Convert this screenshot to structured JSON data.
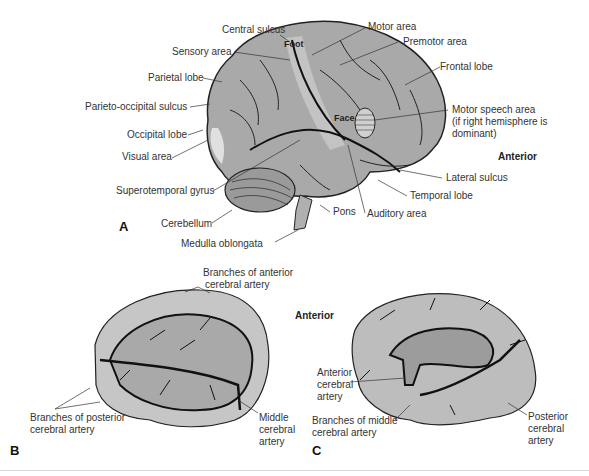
{
  "panels": {
    "A": {
      "letter": "A",
      "orientation": "Anterior",
      "labels": {
        "central_sulcus": "Central sulcus",
        "sensory_area": "Sensory area",
        "parietal_lobe": "Parietal lobe",
        "parieto_occipital_sulcus": "Parieto-occipital sulcus",
        "occipital_lobe": "Occipital lobe",
        "visual_area": "Visual area",
        "superotemporal_gyrus": "Superotemporal gyrus",
        "cerebellum": "Cerebellum",
        "medulla_oblongata": "Medulla oblongata",
        "motor_area": "Motor area",
        "premotor_area": "Premotor area",
        "frontal_lobe": "Frontal lobe",
        "motor_speech_1": "Motor speech area",
        "motor_speech_2": "(if right hemisphere is",
        "motor_speech_3": "dominant)",
        "lateral_sulcus": "Lateral sulcus",
        "temporal_lobe": "Temporal lobe",
        "pons": "Pons",
        "auditory_area": "Auditory area",
        "foot": "Foot",
        "face": "Face"
      }
    },
    "B": {
      "letter": "B",
      "orientation": "Anterior",
      "labels": {
        "anterior_branches_1": "Branches of anterior",
        "anterior_branches_2": "cerebral artery",
        "posterior_branches_1": "Branches of posterior",
        "posterior_branches_2": "cerebral artery",
        "middle_1": "Middle",
        "middle_2": "cerebral",
        "middle_3": "artery"
      }
    },
    "C": {
      "letter": "C",
      "labels": {
        "anterior_1": "Anterior",
        "anterior_2": "cerebral",
        "anterior_3": "artery",
        "middle_branches_1": "Branches of middle",
        "middle_branches_2": "cerebral artery",
        "posterior_1": "Posterior",
        "posterior_2": "cerebral",
        "posterior_3": "artery"
      }
    }
  },
  "colors": {
    "brain_fill": "#a9a9a9",
    "brain_light": "#c6c6c6",
    "vessel": "#111111",
    "line": "#333333"
  }
}
